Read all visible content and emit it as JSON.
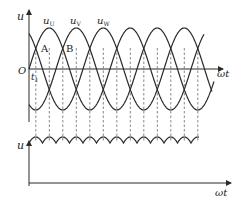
{
  "diagram": {
    "top_plot": {
      "y_axis_label": "u",
      "x_axis_label": "ωt",
      "origin_label": "O",
      "time_marker": "t",
      "time_marker_sub": "1",
      "phases": [
        {
          "name": "u",
          "sub": "U",
          "peak_x": 49.5
        },
        {
          "name": "u",
          "sub": "V",
          "peak_x": 76.5
        },
        {
          "name": "u",
          "sub": "W",
          "peak_x": 103.5
        }
      ],
      "points": [
        {
          "label": "A",
          "x": 36
        },
        {
          "label": "B",
          "x": 63
        }
      ]
    },
    "bottom_plot": {
      "y_axis_label": "u",
      "x_axis_label": "ωt"
    },
    "colors": {
      "stroke": "#2a2a2a",
      "dash": "#555555",
      "background": "#ffffff"
    }
  }
}
